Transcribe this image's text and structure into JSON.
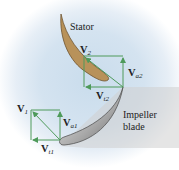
{
  "diagram": {
    "labels": {
      "stator": "Stator",
      "impeller_line1": "Impeller",
      "impeller_line2": "blade"
    },
    "vectors": {
      "v2": {
        "main": "V",
        "sub": "2"
      },
      "va2": {
        "main": "V",
        "sub": "a2"
      },
      "vt2": {
        "main": "V",
        "sub": "t2"
      },
      "v1": {
        "main": "V",
        "sub": "1"
      },
      "va1": {
        "main": "V",
        "sub": "a1"
      },
      "vt1": {
        "main": "V",
        "sub": "t1"
      }
    },
    "colors": {
      "stator_fill": "#b8925a",
      "vector_green": "#4e9a5a",
      "impeller_shadow": "#c8c8c8",
      "background_glow": "#cfe0ee"
    }
  }
}
